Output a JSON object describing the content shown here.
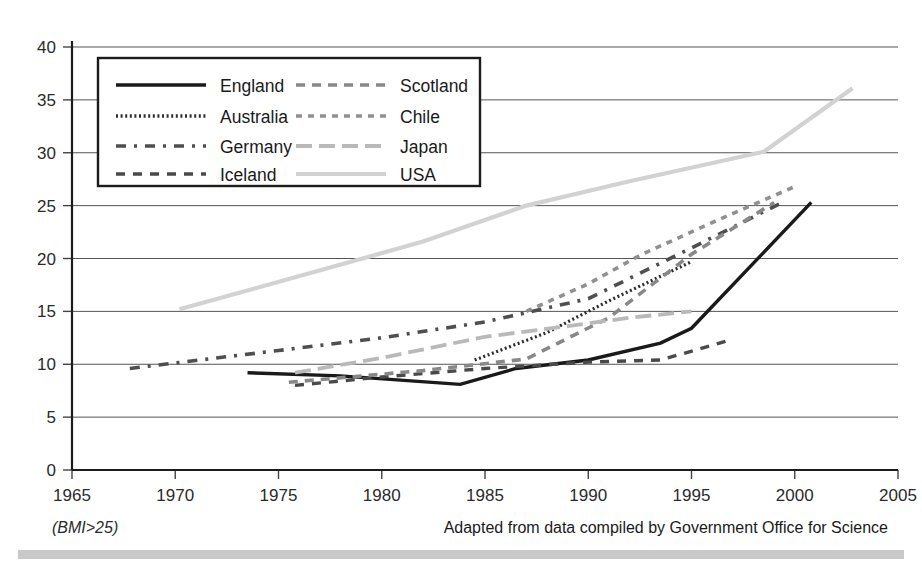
{
  "chart_data": {
    "type": "line",
    "title": "",
    "subtitle": "",
    "xlabel": "",
    "ylabel": "",
    "xlim": [
      1965,
      2005
    ],
    "ylim": [
      0,
      40
    ],
    "xticks": [
      1965,
      1970,
      1975,
      1980,
      1985,
      1990,
      1995,
      2000,
      2005
    ],
    "yticks": [
      0,
      5,
      10,
      15,
      20,
      25,
      30,
      35,
      40
    ],
    "grid": "horizontal",
    "legend_position": "top-left-inside",
    "note_left": "(BMI>25)",
    "note_right": "Adapted from data compiled by Government Office for Science",
    "series": [
      {
        "name": "England",
        "color": "#1a1a1a",
        "style": "solid",
        "dash": "none",
        "width": 3.4,
        "x": [
          1973.5,
          1978.0,
          1983.8,
          1986.5,
          1990.0,
          1993.5,
          1995.0,
          2000.8
        ],
        "y": [
          9.2,
          8.9,
          8.1,
          9.6,
          10.4,
          12.0,
          13.4,
          25.3
        ]
      },
      {
        "name": "Australia",
        "color": "#2e2e2e",
        "style": "dotted",
        "dash": "2 2.6",
        "width": 3.2,
        "x": [
          1984.5,
          1988.0,
          1991.0,
          1995.0
        ],
        "y": [
          10.4,
          13.0,
          16.0,
          19.7
        ]
      },
      {
        "name": "Germany",
        "color": "#4f4f4f",
        "style": "dash-dot",
        "dash": "10 8 3 8",
        "width": 3.6,
        "x": [
          1967.8,
          1975.0,
          1980.0,
          1985.0,
          1990.0,
          1995.0,
          1999.5
        ],
        "y": [
          9.6,
          11.3,
          12.5,
          14.0,
          16.2,
          21.0,
          25.4
        ]
      },
      {
        "name": "Iceland",
        "color": "#4a4a4a",
        "style": "dashed",
        "dash": "9 8",
        "width": 3.4,
        "x": [
          1975.8,
          1980.0,
          1985.0,
          1990.0,
          1993.5,
          1996.9
        ],
        "y": [
          8.0,
          8.8,
          9.6,
          10.2,
          10.4,
          12.3
        ]
      },
      {
        "name": "Scotland",
        "color": "#888888",
        "style": "medium-dash",
        "dash": "9 7",
        "width": 3.6,
        "x": [
          1975.5,
          1982.0,
          1987.0,
          1991.0,
          1995.0,
          1999.0
        ],
        "y": [
          8.3,
          9.4,
          10.5,
          14.4,
          20.4,
          25.3
        ]
      },
      {
        "name": "Chile",
        "color": "#909090",
        "style": "short-dash",
        "dash": "6 6",
        "width": 3.6,
        "x": [
          1987.0,
          1990.0,
          1992.5,
          1996.0,
          2000.0
        ],
        "y": [
          15.0,
          17.6,
          20.3,
          23.4,
          26.8
        ]
      },
      {
        "name": "Japan",
        "color": "#b9b9b9",
        "style": "long-dash",
        "dash": "16 7",
        "width": 3.8,
        "x": [
          1975.8,
          1980.0,
          1985.0,
          1989.0,
          1992.0,
          1995.0
        ],
        "y": [
          9.2,
          10.6,
          12.6,
          13.6,
          14.4,
          15.0
        ]
      },
      {
        "name": "USA",
        "color": "#d2d2d2",
        "style": "solid",
        "dash": "none",
        "width": 4.2,
        "x": [
          1970.2,
          1976.5,
          1982.0,
          1987.0,
          1992.0,
          1998.5,
          2002.8
        ],
        "y": [
          15.2,
          18.6,
          21.6,
          25.0,
          27.3,
          30.1,
          36.1
        ]
      }
    ]
  },
  "legend": {
    "columns": [
      [
        "England",
        "Australia",
        "Germany",
        "Iceland"
      ],
      [
        "Scotland",
        "Chile",
        "Japan",
        "USA"
      ]
    ]
  },
  "axes": {
    "y_tick_labels": [
      "40",
      "35",
      "30",
      "25",
      "20",
      "15",
      "10",
      "5",
      "0"
    ],
    "x_tick_labels": [
      "1965",
      "1970",
      "1975",
      "1980",
      "1985",
      "1990",
      "1995",
      "2000",
      "2005"
    ]
  }
}
